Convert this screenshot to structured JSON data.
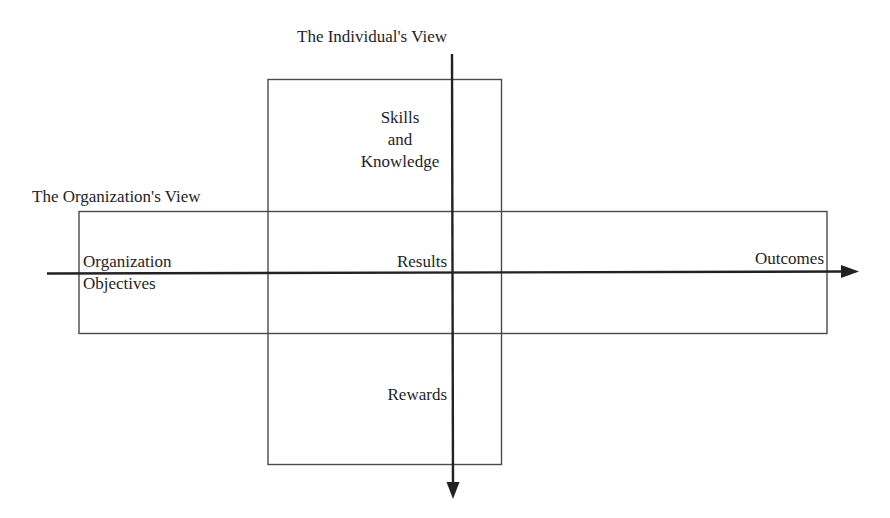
{
  "diagram": {
    "type": "cross-axis conceptual diagram",
    "colors": {
      "line": "#222222",
      "box": "#4a4a4a",
      "text": "#1e1e1e",
      "background": "#ffffff"
    },
    "vertical_axis": {
      "title": "The Individual's View",
      "direction": "down"
    },
    "horizontal_axis": {
      "title": "The Organization's View",
      "direction": "right"
    },
    "labels": {
      "skills_line1": "Skills",
      "skills_line2": "and",
      "skills_line3": "Knowledge",
      "org_objectives_line1": "Organization",
      "org_objectives_line2": "Objectives",
      "results": "Results",
      "outcomes": "Outcomes",
      "rewards": "Rewards"
    }
  }
}
